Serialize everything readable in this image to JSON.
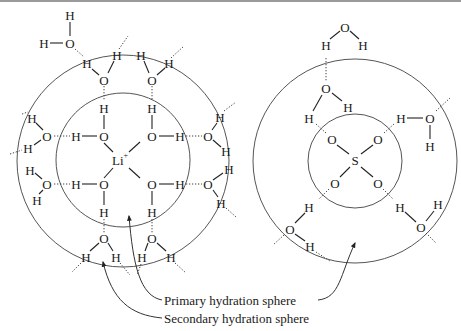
{
  "figure": {
    "left_panel": {
      "center_ion": "Li",
      "center_charge": "+",
      "ligand_atom": "O",
      "hydrogen_atom": "H"
    },
    "right_panel": {
      "center_atom": "S",
      "ligand_atom": "O",
      "hydrogen_atom": "H"
    },
    "labels": {
      "primary": "Primary hydration sphere",
      "secondary": "Secondary hydration sphere"
    }
  }
}
